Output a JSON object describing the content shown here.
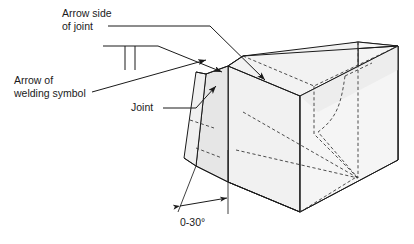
{
  "figure": {
    "background_color": "#ffffff",
    "line_color": "#1a1a1a",
    "labels": {
      "arrow_side_line1": "Arrow side",
      "arrow_side_line2": "of joint",
      "arrow_of_line1": "Arrow of",
      "arrow_of_line2": "welding symbol",
      "joint": "Joint",
      "angle_dimension": "0-30°"
    },
    "faces": {
      "top_face_color": "#f7f7f7",
      "front_face_color": "#f2f2f2",
      "bevel_face_color": "#e6e6e6",
      "groove_face_color": "#ededed",
      "end_face_color": "#f4f4f4"
    },
    "symbol": {
      "name": "square-groove-weld-symbol",
      "reference_line": "horizontal",
      "tick_count": 2
    }
  }
}
